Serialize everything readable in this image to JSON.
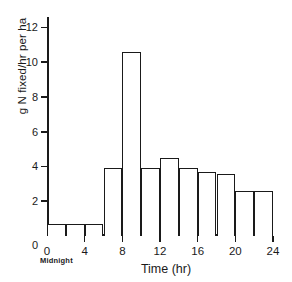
{
  "chart_data": {
    "type": "bar",
    "title": "",
    "subtitle": "",
    "xlabel": "Time (hr)",
    "ylabel": "g N fixed/hr per ha",
    "xlim": [
      0,
      24
    ],
    "ylim": [
      0,
      12.6
    ],
    "grid": false,
    "legend": null,
    "bin_width": 2,
    "annotations": [
      {
        "text": "Midnight",
        "anchor_x": 0,
        "position": "below-x-axis-origin"
      }
    ],
    "xticks": [
      0,
      4,
      8,
      12,
      16,
      20,
      24
    ],
    "xtick_labels": [
      "0",
      "4",
      "8",
      "12",
      "16",
      "20",
      "24"
    ],
    "yticks": [
      2,
      4,
      6,
      8,
      10,
      12
    ],
    "ytick_labels": [
      "2",
      "4",
      "6",
      "8",
      "10",
      "12"
    ],
    "zero_label": "0",
    "categories": [
      "0-2",
      "2-4",
      "4-6",
      "6-8",
      "8-10",
      "10-12",
      "12-14",
      "14-16",
      "16-18",
      "18-20",
      "20-22",
      "22-24"
    ],
    "bin_starts": [
      0,
      2,
      4,
      6,
      8,
      10,
      12,
      14,
      16,
      18,
      20,
      22
    ],
    "bin_ends": [
      2,
      4,
      6,
      8,
      10,
      12,
      14,
      16,
      18,
      20,
      22,
      24
    ],
    "values": [
      0.7,
      0.7,
      0.7,
      3.9,
      10.6,
      3.9,
      4.5,
      3.9,
      3.7,
      3.55,
      2.6,
      2.6
    ],
    "colors": {
      "bar_fill": "#ffffff",
      "bar_stroke": "#1a1a1a",
      "axis": "#1a1a1a",
      "text": "#1a1a1a",
      "background": "#ffffff"
    }
  }
}
